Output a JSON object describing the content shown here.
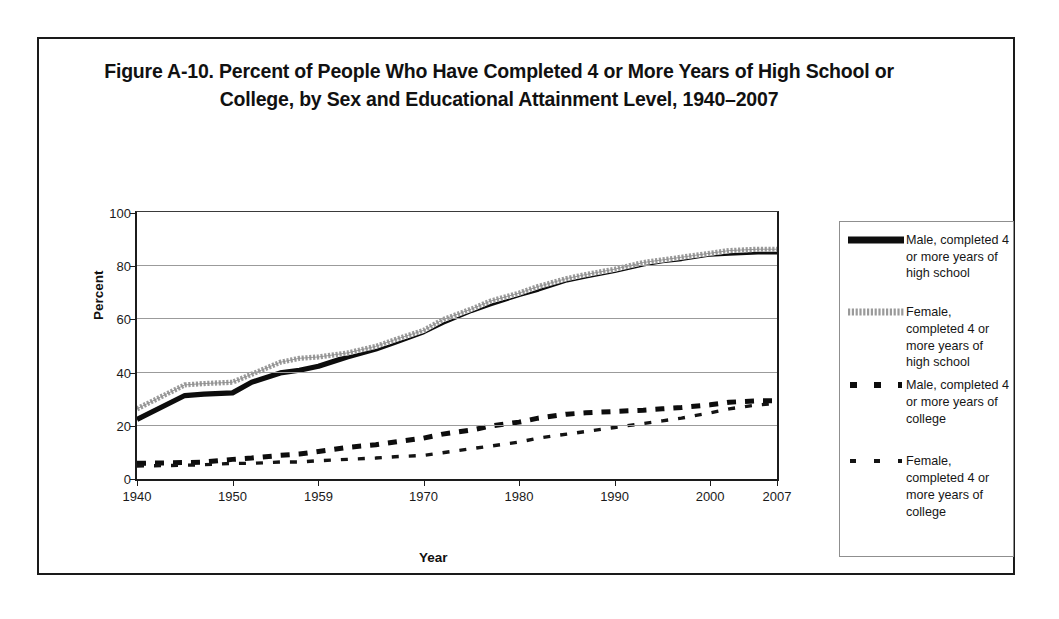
{
  "figure": {
    "title": "Figure A-10. Percent of People Who Have Completed 4 or More Years of High School or College, by Sex and Educational Attainment Level, 1940–2007"
  },
  "axes": {
    "ylabel": "Percent",
    "xlabel": "Year",
    "yticks": [
      "0",
      "20",
      "40",
      "60",
      "80",
      "100"
    ],
    "xticks": [
      "1940",
      "1950",
      "1959",
      "1970",
      "1980",
      "1990",
      "2000",
      "2007"
    ]
  },
  "legend": {
    "entries": [
      {
        "label": "Male, completed 4 or more years of high school",
        "style": "solid-thick-black",
        "color": "#0d0d0d"
      },
      {
        "label": "Female, completed 4 or more years of high school",
        "style": "solid-thick-hatched-gray",
        "color": "#a9a9a9"
      },
      {
        "label": "Male, completed 4 or more years of college",
        "style": "dashed-thick-black",
        "color": "#0d0d0d"
      },
      {
        "label": "Female, completed 4 or more years of college",
        "style": "dashed-thin-black",
        "color": "#141414"
      }
    ]
  },
  "chart_data": {
    "type": "line",
    "title": "Figure A-10. Percent of People Who Have Completed 4 or More Years of High School or College, by Sex and Educational Attainment Level, 1940–2007",
    "xlabel": "Year",
    "ylabel": "Percent",
    "xlim": [
      1940,
      2007
    ],
    "ylim": [
      0,
      100
    ],
    "ytick_values": [
      0,
      20,
      40,
      60,
      80,
      100
    ],
    "xtick_values": [
      1940,
      1950,
      1959,
      1970,
      1980,
      1990,
      2000,
      2007
    ],
    "grid": "horizontal",
    "legend_position": "right-outside",
    "x": [
      1940,
      1945,
      1947,
      1950,
      1952,
      1955,
      1957,
      1959,
      1962,
      1965,
      1967,
      1970,
      1972,
      1975,
      1977,
      1980,
      1982,
      1985,
      1987,
      1990,
      1993,
      1995,
      1997,
      2000,
      2002,
      2005,
      2007
    ],
    "series": [
      {
        "name": "Male, completed 4 or more years of high school",
        "values": [
          22.0,
          31.0,
          31.5,
          32.0,
          36.0,
          39.5,
          40.5,
          42.0,
          45.5,
          48.5,
          51.0,
          55.0,
          58.5,
          63.0,
          65.5,
          69.0,
          71.0,
          74.5,
          76.0,
          78.0,
          80.5,
          81.7,
          82.5,
          84.2,
          84.5,
          85.0,
          85.0
        ]
      },
      {
        "name": "Female, completed 4 or more years of high school",
        "values": [
          26.0,
          35.0,
          35.5,
          36.0,
          39.0,
          43.5,
          45.0,
          45.5,
          47.0,
          49.5,
          52.0,
          55.5,
          59.5,
          63.5,
          66.5,
          69.5,
          72.0,
          75.0,
          76.5,
          78.5,
          81.0,
          82.0,
          83.0,
          84.5,
          85.5,
          86.0,
          86.0
        ]
      },
      {
        "name": "Male, completed 4 or more years of college",
        "values": [
          5.5,
          5.8,
          6.0,
          7.0,
          7.5,
          8.5,
          9.0,
          10.0,
          11.5,
          12.5,
          13.5,
          15.0,
          16.5,
          18.0,
          19.5,
          21.0,
          22.5,
          24.0,
          24.5,
          25.0,
          25.5,
          26.0,
          26.5,
          27.5,
          28.5,
          29.0,
          29.0
        ]
      },
      {
        "name": "Female, completed 4 or more years of college",
        "values": [
          4.5,
          4.8,
          5.0,
          5.5,
          5.5,
          6.0,
          6.0,
          6.5,
          7.0,
          7.5,
          8.0,
          8.5,
          9.5,
          11.0,
          12.0,
          13.5,
          15.0,
          16.5,
          17.5,
          19.0,
          20.5,
          21.5,
          22.5,
          24.5,
          26.0,
          27.5,
          28.0
        ]
      }
    ]
  }
}
